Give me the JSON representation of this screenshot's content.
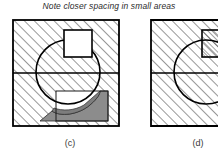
{
  "caption": {
    "text": "Note closer spacing in small areas"
  },
  "figures": [
    {
      "id": "fig-c",
      "label": "(c)",
      "description": "Section view: square block with inscribed circle, horizontal parting line, white rectangular cutout at top, gray shaded crescent region at lower right",
      "box": {
        "x": 0,
        "y": 0,
        "width": 108,
        "height": 108
      },
      "parting_line_y": 54,
      "circle": {
        "cx": 56,
        "cy": 53,
        "r": 32
      },
      "white_square": {
        "x": 52,
        "y": 11,
        "width": 28,
        "height": 27
      },
      "inner_rect": {
        "x": 44,
        "y": 72,
        "width": 52,
        "height": 30
      },
      "hatch": {
        "angle_deg": 45,
        "upper_spacing_px": 7,
        "lower_spacing_px": 7,
        "small_area_spacing_px": 4,
        "line_color": "#1a1a1a",
        "line_width": 0.9
      },
      "shaded_region": {
        "fill": "#8c8c8c",
        "label": "gray crescent / L-band"
      }
    },
    {
      "id": "fig-d",
      "label": "(d)",
      "description": "Section view cropped at right image edge: square block with inscribed circle, horizontal parting line, hatched rectangular inset at upper right",
      "box": {
        "x": 0,
        "y": 0,
        "width": 108,
        "height": 108
      },
      "parting_line_y": 54,
      "circle": {
        "cx": 56,
        "cy": 53,
        "r": 32
      },
      "inset_rect": {
        "x": 52,
        "y": 11,
        "width": 38,
        "height": 27
      },
      "hatch": {
        "angle_deg": 45,
        "upper_spacing_px": 7,
        "lower_spacing_px": 7,
        "small_area_spacing_px": 4,
        "line_color": "#1a1a1a",
        "line_width": 0.9
      },
      "clipped_at_x": 68
    }
  ],
  "colors": {
    "background": "#ffffff",
    "stroke": "#000000",
    "hatch": "#1a1a1a",
    "shade_gray": "#8c8c8c",
    "text": "#2b2b2b"
  }
}
